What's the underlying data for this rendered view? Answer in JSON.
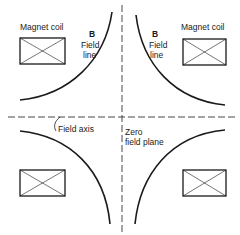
{
  "diagram": {
    "type": "quadrupole magnet field diagram",
    "labels": {
      "magnet_coil_left": "Magnet coil",
      "magnet_coil_right": "Magnet coil",
      "b_left": "B",
      "field_line_left_1": "Field",
      "field_line_left_2": "line",
      "b_right": "B",
      "field_line_right_1": "Field",
      "field_line_right_2": "line",
      "field_axis": "Field axis",
      "zero_plane_1": "Zero",
      "zero_plane_2": "field plane"
    },
    "colors": {
      "line": "#1a1a1a",
      "background": "#ffffff"
    },
    "coils": [
      {
        "position": "top-left"
      },
      {
        "position": "top-right"
      },
      {
        "position": "bottom-left"
      },
      {
        "position": "bottom-right"
      }
    ]
  }
}
